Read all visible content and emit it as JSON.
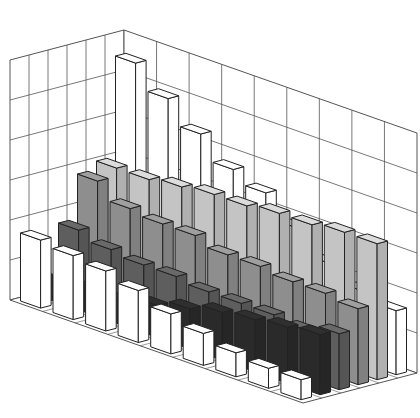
{
  "chart_data": {
    "type": "bar3d",
    "title": "",
    "xlabel": "",
    "ylabel": "",
    "zlabel": "",
    "grid": true,
    "legend": null,
    "categories": [
      "1",
      "2",
      "3",
      "4",
      "5",
      "6",
      "7",
      "8",
      "9"
    ],
    "zlim": [
      0,
      6
    ],
    "series": [
      {
        "name": "Series 1 (front)",
        "color": "#ffffff",
        "values": [
          1.7,
          1.6,
          1.5,
          1.3,
          1.0,
          0.8,
          0.6,
          0.5,
          0.5
        ]
      },
      {
        "name": "Series 2",
        "color": "#2a2a2a",
        "values": [
          0.5,
          0.6,
          0.6,
          0.8,
          1.0,
          1.2,
          1.3,
          1.4,
          1.5
        ]
      },
      {
        "name": "Series 3",
        "color": "#5e5e5e",
        "values": [
          1.7,
          1.5,
          1.4,
          1.4,
          1.3,
          1.3,
          1.3,
          1.2,
          1.4
        ]
      },
      {
        "name": "Series 4",
        "color": "#8e8e8e",
        "values": [
          2.8,
          2.4,
          2.3,
          2.3,
          2.1,
          2.1,
          2.0,
          2.0,
          1.9
        ]
      },
      {
        "name": "Series 5",
        "color": "#c4c4c4",
        "values": [
          3.0,
          3.0,
          3.1,
          3.2,
          3.2,
          3.3,
          3.3,
          3.4,
          3.4
        ]
      },
      {
        "name": "Series 6 (back)",
        "color": "#ffffff",
        "values": [
          5.5,
          4.9,
          4.3,
          3.7,
          3.4,
          2.8,
          2.2,
          1.8,
          1.6
        ]
      }
    ]
  },
  "axes": {
    "gridline_color": "#555555",
    "edge_color": "#222222"
  }
}
